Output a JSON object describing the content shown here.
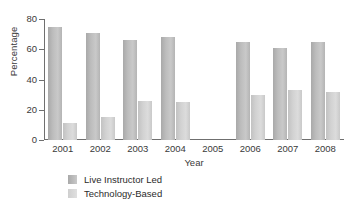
{
  "chart_data": {
    "type": "bar",
    "title": "",
    "xlabel": "Year",
    "ylabel": "Percentage",
    "categories": [
      "2001",
      "2002",
      "2003",
      "2004",
      "2005",
      "2006",
      "2007",
      "2008"
    ],
    "series": [
      {
        "name": "Live Instructor Led",
        "color": "#b9b9b9",
        "values": [
          75,
          71,
          66,
          68,
          null,
          65,
          61,
          65
        ]
      },
      {
        "name": "Technology-Based",
        "color": "#d6d6d6",
        "values": [
          11,
          15,
          26,
          25,
          null,
          30,
          33,
          32
        ]
      }
    ],
    "ylim": [
      0,
      80
    ],
    "yticks": [
      0,
      20,
      40,
      60,
      80
    ],
    "ytick_labels": [
      "0",
      "20",
      "40",
      "60",
      "80"
    ],
    "grid": false,
    "legend_position": "bottom-left"
  },
  "axes": {
    "y_title": "Percentage",
    "x_title": "Year"
  },
  "legend": {
    "items": [
      {
        "label": "Live Instructor Led",
        "swatch": "series-live"
      },
      {
        "label": "Technology-Based",
        "swatch": "series-tech"
      }
    ]
  }
}
